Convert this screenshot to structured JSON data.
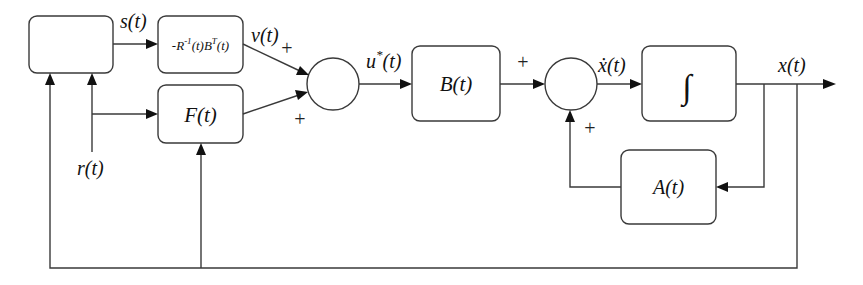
{
  "diagram": {
    "type": "block-diagram",
    "title": "",
    "blocks": {
      "controller_input": {
        "label": ""
      },
      "gain": {
        "label": "-R⁻¹(t)Bᵀ(t)",
        "parts": {
          "pre": "-R",
          "sup1": "-1",
          "mid": "(t)B",
          "sup2": "T",
          "post": "(t)"
        }
      },
      "feedforward": {
        "label": "F(t)"
      },
      "input_matrix": {
        "label": "B(t)"
      },
      "integrator": {
        "label": "∫"
      },
      "state_matrix": {
        "label": "A(t)"
      }
    },
    "signals": {
      "s": "s(t)",
      "v": "v(t)",
      "u_star": {
        "base": "u",
        "sup": "*",
        "arg": "(t)"
      },
      "x_dot": "ẋ(t)",
      "x": "x(t)",
      "r": "r(t)"
    },
    "summing_junctions": {
      "sum1": {
        "signs": [
          "+",
          "+"
        ]
      },
      "sum2": {
        "signs": [
          "+",
          "+"
        ]
      }
    },
    "colors": {
      "line": "#3a3a3a",
      "arrow": "#111111",
      "text": "#111111",
      "background": "#ffffff"
    }
  }
}
